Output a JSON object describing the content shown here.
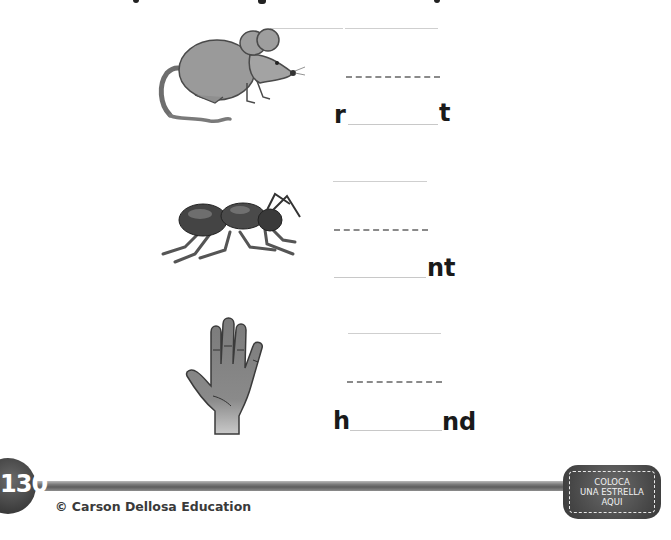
{
  "worksheet": {
    "items": [
      {
        "picture": "rat",
        "prefix": "r",
        "suffix": "t"
      },
      {
        "picture": "ant",
        "prefix": "",
        "suffix": "nt"
      },
      {
        "picture": "hand",
        "prefix": "h",
        "suffix": "nd"
      }
    ]
  },
  "footer": {
    "page_number": "130",
    "copyright": "© Carson Dellosa Education",
    "badge": {
      "line1": "COLOCA",
      "line2": "UNA ESTRELLA",
      "line3": "AQUI"
    }
  },
  "colors": {
    "text": "#1a1a1a",
    "footer_dark": "#3b3b3b",
    "guide_line": "#cfcfcf",
    "dashed_line": "#8a8a8a"
  }
}
